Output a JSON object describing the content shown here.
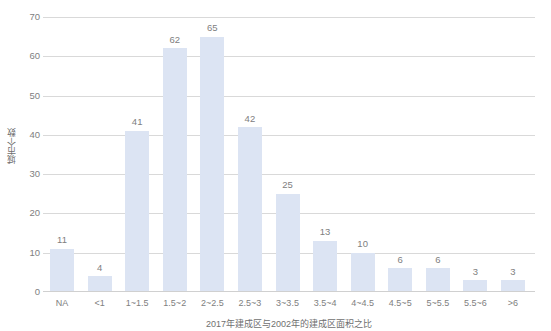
{
  "chart_data": {
    "type": "bar",
    "title": "",
    "xlabel": "2017年建成区与2002年的建成区面积之比",
    "ylabel": "城市个数",
    "categories": [
      "NA",
      "<1",
      "1~1.5",
      "1.5~2",
      "2~2.5",
      "2.5~3",
      "3~3.5",
      "3.5~4",
      "4~4.5",
      "4.5~5",
      "5~5.5",
      "5.5~6",
      ">6"
    ],
    "values": [
      11,
      4,
      41,
      62,
      65,
      42,
      25,
      13,
      10,
      6,
      6,
      3,
      3
    ],
    "ylim": [
      0,
      70
    ],
    "yticks": [
      0,
      10,
      20,
      30,
      40,
      50,
      60,
      70
    ],
    "ytick_labels": [
      "0",
      "10",
      "20",
      "30",
      "40",
      "50",
      "60",
      "70"
    ],
    "grid": true,
    "legend": "none",
    "data_labels": [
      "11",
      "4",
      "41",
      "62",
      "65",
      "42",
      "25",
      "13",
      "10",
      "6",
      "6",
      "3",
      "3"
    ],
    "colors": {
      "bar_fill": "#dce4f3",
      "gridline": "#d9d9d9",
      "tick_text": "#808080",
      "axis_title_text": "#6f6f6f",
      "background": "#ffffff"
    }
  }
}
